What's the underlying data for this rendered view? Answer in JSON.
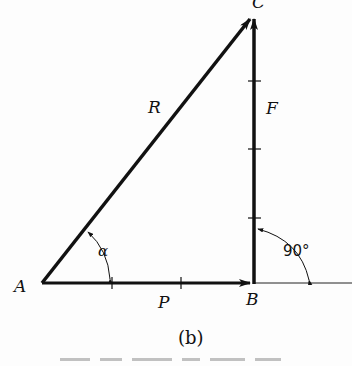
{
  "figure": {
    "caption": "(b)",
    "caption_letter": "b",
    "colors": {
      "ink": "#111111",
      "background": "#fdfdfd"
    }
  },
  "vertices": {
    "A": {
      "label": "A",
      "x": 42,
      "y": 283
    },
    "B": {
      "label": "B",
      "x": 254,
      "y": 283
    },
    "C": {
      "label": "C",
      "x": 254,
      "y": 15
    }
  },
  "vectors": [
    {
      "name": "P",
      "label": "P",
      "from": "A",
      "to": "B",
      "ticks": 2
    },
    {
      "name": "F",
      "label": "F",
      "from": "B",
      "to": "C",
      "ticks": 3
    },
    {
      "name": "R",
      "label": "R",
      "from": "A",
      "to": "C",
      "ticks": 0
    }
  ],
  "angles": {
    "alpha": {
      "label": "α",
      "at": "A",
      "between": [
        "P",
        "R"
      ]
    },
    "right": {
      "label": "90°",
      "at": "B",
      "between": [
        "F",
        "extension of P"
      ]
    }
  }
}
